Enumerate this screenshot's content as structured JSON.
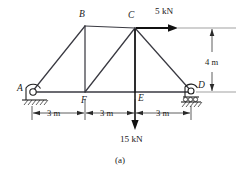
{
  "figure": {
    "caption": "(a)",
    "nodes": [
      {
        "id": "A",
        "label": "A",
        "x": 32,
        "y": 92,
        "label_x": 17,
        "label_y": 91
      },
      {
        "id": "B",
        "label": "B",
        "x": 85,
        "y": 26,
        "label_x": 79,
        "label_y": 17
      },
      {
        "id": "C",
        "label": "C",
        "x": 135,
        "y": 28,
        "label_x": 128,
        "label_y": 18
      },
      {
        "id": "D",
        "label": "D",
        "x": 191,
        "y": 91,
        "label_x": 198,
        "label_y": 88
      },
      {
        "id": "E",
        "label": "E",
        "x": 135,
        "y": 92,
        "label_x": 138,
        "label_y": 101
      },
      {
        "id": "F",
        "label": "F",
        "x": 85,
        "y": 92,
        "label_x": 81,
        "label_y": 103
      }
    ],
    "members": [
      {
        "name": "member-A-B",
        "from": "A",
        "to": "B"
      },
      {
        "name": "member-B-C",
        "from": "B",
        "to": "C"
      },
      {
        "name": "member-C-D",
        "from": "C",
        "to": "D"
      },
      {
        "name": "member-B-F",
        "from": "B",
        "to": "F"
      },
      {
        "name": "member-F-C",
        "from": "F",
        "to": "C"
      },
      {
        "name": "member-C-E",
        "from": "C",
        "to": "E"
      }
    ],
    "bottom_chord": {
      "name": "bottom-chord-A-D",
      "from": "A",
      "to": "D"
    },
    "supports": [
      {
        "name": "pin-support-A",
        "type": "pin",
        "at": "A"
      },
      {
        "name": "roller-support-D",
        "type": "roller",
        "at": "D"
      }
    ],
    "loads": [
      {
        "name": "horizontal-load-5kN",
        "label": "5 kN",
        "magnitude": 5,
        "unit": "kN",
        "direction": "right",
        "applied_at": "C",
        "label_x": 155,
        "label_y": 14
      },
      {
        "name": "vertical-load-15kN",
        "label": "15 kN",
        "magnitude": 15,
        "unit": "kN",
        "direction": "down",
        "applied_at": "E",
        "label_x": 120,
        "label_y": 142
      }
    ],
    "dimensions": [
      {
        "name": "dimension-A-F",
        "label": "3 m",
        "value": 3,
        "unit": "m",
        "orientation": "horizontal",
        "label_x": 47,
        "label_y": 116
      },
      {
        "name": "dimension-F-E",
        "label": "3 m",
        "value": 3,
        "unit": "m",
        "orientation": "horizontal",
        "label_x": 100,
        "label_y": 116
      },
      {
        "name": "dimension-E-D",
        "label": "3 m",
        "value": 3,
        "unit": "m",
        "orientation": "horizontal",
        "label_x": 156,
        "label_y": 116
      },
      {
        "name": "dimension-height",
        "label": "4 m",
        "value": 4,
        "unit": "m",
        "orientation": "vertical",
        "label_x": 216,
        "label_y": 62
      }
    ],
    "colors": {
      "member": "#3a3a42",
      "force": "#111111",
      "dimension": "#2a2a2a",
      "background": "#ffffff"
    }
  }
}
